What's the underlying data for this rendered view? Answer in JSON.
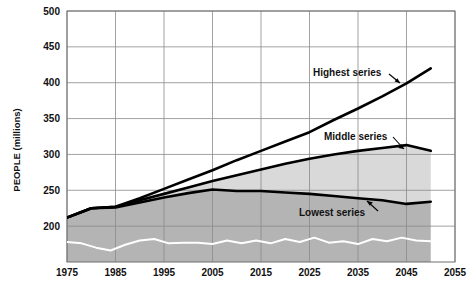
{
  "chart_data": {
    "type": "area",
    "title": "",
    "subtitle": "",
    "xlabel": "",
    "ylabel": "PEOPLE (millions)",
    "xlim": [
      1975,
      2055
    ],
    "ylim": [
      150,
      500
    ],
    "yaxis_visible_min": 200,
    "grid": true,
    "legend_position": "inline-annotations",
    "x_ticks": [
      "1975",
      "1985",
      "1995",
      "2005",
      "2015",
      "2025",
      "2035",
      "2045",
      "2055"
    ],
    "x_tick_values": [
      1975,
      1985,
      1995,
      2005,
      2015,
      2025,
      2035,
      2045,
      2055
    ],
    "y_ticks": [
      "200",
      "250",
      "300",
      "350",
      "400",
      "450",
      "500"
    ],
    "y_tick_values": [
      200,
      250,
      300,
      350,
      400,
      450,
      500
    ],
    "series": [
      {
        "name": "Highest series",
        "label": "Highest series",
        "color": "#000000",
        "x": [
          1975,
          1980,
          1985,
          1990,
          1995,
          2000,
          2005,
          2010,
          2015,
          2020,
          2025,
          2030,
          2035,
          2040,
          2045,
          2050
        ],
        "values": [
          212,
          225,
          227,
          239,
          252,
          265,
          278,
          292,
          305,
          318,
          331,
          348,
          364,
          381,
          399,
          420
        ]
      },
      {
        "name": "Middle series",
        "label": "Middle series",
        "color": "#000000",
        "x": [
          1975,
          1980,
          1985,
          1990,
          1995,
          2000,
          2005,
          2010,
          2015,
          2020,
          2025,
          2030,
          2035,
          2040,
          2045,
          2050
        ],
        "values": [
          212,
          225,
          227,
          236,
          245,
          254,
          263,
          271,
          279,
          287,
          294,
          300,
          305,
          309,
          313,
          305
        ]
      },
      {
        "name": "Lowest series",
        "label": "Lowest series",
        "color": "#000000",
        "x": [
          1975,
          1980,
          1985,
          1990,
          1995,
          2000,
          2005,
          2010,
          2015,
          2020,
          2025,
          2030,
          2035,
          2040,
          2045,
          2050
        ],
        "values": [
          212,
          225,
          226,
          233,
          240,
          246,
          251,
          249,
          249,
          247,
          245,
          242,
          239,
          236,
          231,
          234
        ]
      },
      {
        "name": "Baseline zigzag",
        "label": "",
        "color": "#ffffff",
        "x": [
          1975,
          1978,
          1981,
          1984,
          1987,
          1990,
          1993,
          1996,
          1999,
          2002,
          2005,
          2008,
          2011,
          2014,
          2017,
          2020,
          2023,
          2026,
          2029,
          2032,
          2035,
          2038,
          2041,
          2044,
          2047,
          2050
        ],
        "values": [
          178,
          176,
          170,
          166,
          174,
          180,
          182,
          176,
          177,
          177,
          175,
          180,
          176,
          180,
          176,
          182,
          178,
          184,
          177,
          179,
          175,
          182,
          179,
          184,
          180,
          179
        ]
      }
    ],
    "fills": [
      {
        "name": "middle-band",
        "between": [
          "Middle series",
          "Lowest series"
        ],
        "color": "#d9d9d9"
      },
      {
        "name": "lowest-band",
        "between": [
          "Lowest series",
          "axis-floor"
        ],
        "color": "#b4b4b4"
      }
    ],
    "annotations": [
      {
        "name": "highest-series-annotation",
        "text": "Highest series",
        "x": 1975,
        "y": 500
      },
      {
        "name": "middle-series-annotation",
        "text": "Middle series",
        "x": 1975,
        "y": 500
      },
      {
        "name": "lowest-series-annotation",
        "text": "Lowest series",
        "x": 1975,
        "y": 500
      }
    ]
  },
  "labels": {
    "y_axis_title": "PEOPLE (millions)",
    "highest": "Highest series",
    "middle": "Middle series",
    "lowest": "Lowest series",
    "y0": "200",
    "y1": "250",
    "y2": "300",
    "y3": "350",
    "y4": "400",
    "y5": "450",
    "y6": "500",
    "x0": "1975",
    "x1": "1985",
    "x2": "1995",
    "x3": "2005",
    "x4": "2015",
    "x5": "2025",
    "x6": "2035",
    "x7": "2045",
    "x8": "2055"
  },
  "colors": {
    "upper_band": "#d9d9d9",
    "lower_band": "#b4b4b4",
    "line": "#000000",
    "zigzag": "#ffffff",
    "grid": "#8a8a8a",
    "frame": "#6f6f6f",
    "background": "#ffffff"
  }
}
